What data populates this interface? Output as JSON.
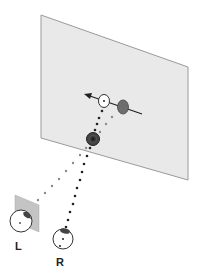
{
  "diagram": {
    "colors": {
      "plane_fill": "#e8e8e8",
      "plane_edge": "#9a9a9a",
      "small_plane_fill": "#c8c8c8",
      "dark_disc": "#555555",
      "mid_disc": "#7a7a7a",
      "white_disc": "#ffffff",
      "dots_left": "#8a8a8a",
      "dots_right": "#222222",
      "arrow": "#222222"
    },
    "eyes": [
      {
        "id": "left",
        "label": "L"
      },
      {
        "id": "right",
        "label": "R"
      }
    ]
  }
}
